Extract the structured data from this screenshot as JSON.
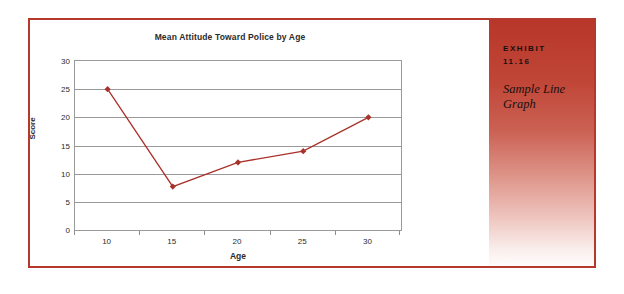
{
  "figure": {
    "border_color": "#b4382c",
    "background": "#ffffff"
  },
  "exhibit": {
    "kicker": "EXHIBIT",
    "number": "11.16",
    "caption": "Sample Line Graph",
    "gradient_top_color": "#b8372a",
    "gradient_bottom_color": "#fefcfb",
    "text_color": "#17100e"
  },
  "chart_data": {
    "type": "line",
    "title": "Mean Attitude Toward Police by Age",
    "xlabel": "Age",
    "ylabel": "Score",
    "categories": [
      "10",
      "15",
      "20",
      "25",
      "30"
    ],
    "x": [
      10,
      15,
      20,
      25,
      30
    ],
    "values": [
      25,
      7.7,
      12,
      14,
      20
    ],
    "ylim": [
      0,
      30
    ],
    "ytick_labels": [
      "0",
      "5",
      "10",
      "15",
      "20",
      "25",
      "30"
    ],
    "ytick_values": [
      0,
      5,
      10,
      15,
      20,
      25,
      30
    ],
    "grid": true,
    "legend": "none",
    "series_color": "#a8322a",
    "marker": "diamond",
    "marker_color": "#a8322a",
    "gridline_color": "#9a9a9a",
    "plot_border_color": "#9a9a9a",
    "text_color": "#2b2b2b"
  }
}
